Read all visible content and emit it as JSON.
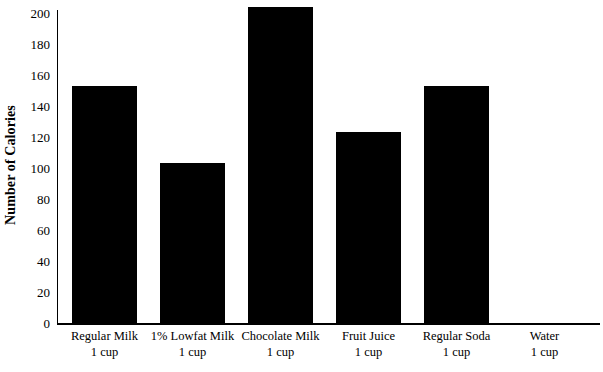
{
  "chart_data": {
    "type": "bar",
    "title": "",
    "subtitle": "",
    "xlabel": "",
    "ylabel": "Number of Calories",
    "categories": [
      "Regular Milk",
      "1% Lowfat Milk",
      "Chocolate Milk",
      "Fruit Juice",
      "Regular Soda",
      "Water"
    ],
    "category_units": [
      "1 cup",
      "1 cup",
      "1 cup",
      "1 cup",
      "1 cup",
      "1 cup"
    ],
    "values": [
      153,
      103,
      204,
      123,
      153,
      0
    ],
    "ylim": [
      0,
      200
    ],
    "ytick_labels": [
      "200",
      "180",
      "160",
      "140",
      "120",
      "100",
      "80",
      "60",
      "40",
      "20",
      "0"
    ],
    "ytick_values": [
      200,
      180,
      160,
      140,
      120,
      100,
      80,
      60,
      40,
      20,
      0
    ],
    "ytick_step": 20,
    "grid": false,
    "legend": false,
    "legend_position": "none",
    "bar_color": "#000000",
    "axis_color": "#000000",
    "background_color": "#ffffff"
  }
}
